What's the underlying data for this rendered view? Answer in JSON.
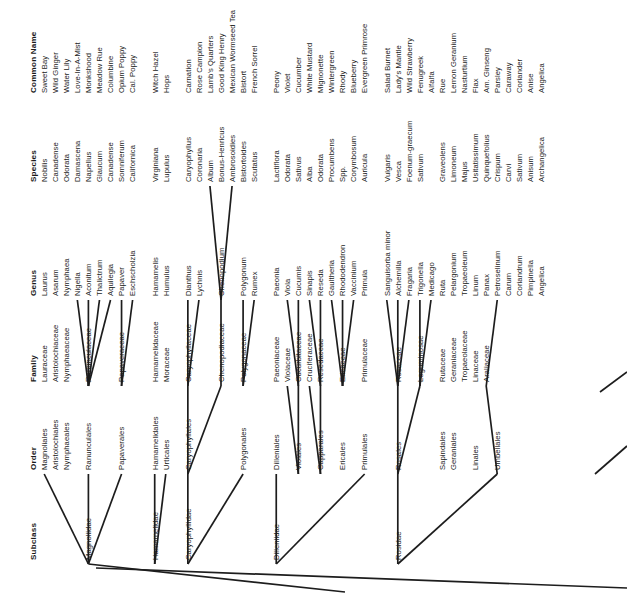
{
  "figure": {
    "kind": "taxonomic-cladogram",
    "text_orientation": "rotated-90-ccw",
    "line_color": "#1d1d1d",
    "background": "#ffffff"
  },
  "columns": [
    {
      "key": "subclass",
      "header": "Subclass",
      "y": 560
    },
    {
      "key": "order",
      "header": "Order",
      "y": 470
    },
    {
      "key": "family",
      "header": "Family",
      "y": 382
    },
    {
      "key": "genus",
      "header": "Genus",
      "y": 296
    },
    {
      "key": "species",
      "header": "Species",
      "y": 182
    },
    {
      "key": "common_name",
      "header": "Common Name",
      "y": 93
    }
  ],
  "header_x": 30,
  "row_pitch": 11.05,
  "first_row_x": 41,
  "rows": [
    {
      "i": 0,
      "common_name": "Sweet Bay",
      "species": "Nobilis",
      "genus": "Laurus",
      "family": "Lauraceae",
      "order": "Magnoliales",
      "subclass": ""
    },
    {
      "i": 1,
      "common_name": "Wild Ginger",
      "species": "Canadense",
      "genus": "Asarum",
      "family": "Aristolochiaceae",
      "order": "Aristolochiales",
      "subclass": ""
    },
    {
      "i": 2,
      "common_name": "Water Lily",
      "species": "Odorata",
      "genus": "Nymphaea",
      "family": "Nymphaeaceae",
      "order": "Nymphaeales",
      "subclass": ""
    },
    {
      "i": 3,
      "common_name": "Love-In-A-Mist",
      "species": "Damascena",
      "genus": "Nigella",
      "family": "",
      "order": "",
      "subclass": ""
    },
    {
      "i": 4,
      "common_name": "Monkshood",
      "species": "Napellus",
      "genus": "Aconitum",
      "family": "Ranunculaceae",
      "order": "Ranunculales",
      "subclass": "Magnoliidae"
    },
    {
      "i": 5,
      "common_name": "Meadow Rue",
      "species": "Glaucum",
      "genus": "Thalictrum",
      "family": "",
      "order": "",
      "subclass": ""
    },
    {
      "i": 6,
      "common_name": "Columbine",
      "species": "Canadense",
      "genus": "Aquilegia",
      "family": "",
      "order": "",
      "subclass": ""
    },
    {
      "i": 7,
      "common_name": "Opium Poppy",
      "species": "Somniferum",
      "genus": "Papaver",
      "family": "Papaveraceae",
      "order": "Papaverales",
      "subclass": ""
    },
    {
      "i": 8,
      "common_name": "Cal. Poppy",
      "species": "Californica",
      "genus": "Eschscholzia",
      "family": "",
      "order": "",
      "subclass": ""
    },
    {
      "i": 9,
      "common_name": "",
      "species": "",
      "genus": "",
      "family": "",
      "order": "",
      "subclass": ""
    },
    {
      "i": 10,
      "common_name": "Witch Hazel",
      "species": "Virginiana",
      "genus": "Hamamelis",
      "family": "Hamamelidaceae",
      "order": "Hamamelidales",
      "subclass": "Hamamelidae"
    },
    {
      "i": 11,
      "common_name": "Hops",
      "species": "Lupulus",
      "genus": "Humulus",
      "family": "Moraceae",
      "order": "Urticales",
      "subclass": ""
    },
    {
      "i": 12,
      "common_name": "",
      "species": "",
      "genus": "",
      "family": "",
      "order": "",
      "subclass": ""
    },
    {
      "i": 13,
      "common_name": "Carnation",
      "species": "Caryophyllus",
      "genus": "Dianthus",
      "family": "Caryophyllaceae",
      "order": "Caryophyllales",
      "subclass": "Caryophyllidae"
    },
    {
      "i": 14,
      "common_name": "Rose Campion",
      "species": "Coronaria",
      "genus": "Lychnis",
      "family": "",
      "order": "",
      "subclass": ""
    },
    {
      "i": 15,
      "common_name": "Lamb's Quarters",
      "species": "Album",
      "genus": "",
      "family": "",
      "order": "",
      "subclass": ""
    },
    {
      "i": 16,
      "common_name": "Good King Henry",
      "species": "Bonus-Henricus",
      "genus": "Chenopodium",
      "family": "Chenopodiaceae",
      "order": "",
      "subclass": ""
    },
    {
      "i": 17,
      "common_name": "Mexican Wormseed Tea",
      "species": "Ambrosoidies",
      "genus": "",
      "family": "",
      "order": "",
      "subclass": ""
    },
    {
      "i": 18,
      "common_name": "Bistort",
      "species": "Bistortoides",
      "genus": "Polygonum",
      "family": "Polygonaceae",
      "order": "Polygonales",
      "subclass": ""
    },
    {
      "i": 19,
      "common_name": "French Sorrel",
      "species": "Scutatus",
      "genus": "Rumex",
      "family": "",
      "order": "",
      "subclass": ""
    },
    {
      "i": 20,
      "common_name": "",
      "species": "",
      "genus": "",
      "family": "",
      "order": "",
      "subclass": ""
    },
    {
      "i": 21,
      "common_name": "Peony",
      "species": "Lactiflora",
      "genus": "Paeonia",
      "family": "Paeoniaceae",
      "order": "Dilleniales",
      "subclass": "Dilleniidae"
    },
    {
      "i": 22,
      "common_name": "Violet",
      "species": "Odorata",
      "genus": "Viola",
      "family": "Violaceae",
      "order": "",
      "subclass": ""
    },
    {
      "i": 23,
      "common_name": "Cucumber",
      "species": "Sativus",
      "genus": "Cucumis",
      "family": "Cucurbitaceae",
      "order": "Violales",
      "subclass": ""
    },
    {
      "i": 24,
      "common_name": "White Mustard",
      "species": "Alba",
      "genus": "Sinapis",
      "family": "Cruciferaceae",
      "order": "",
      "subclass": ""
    },
    {
      "i": 25,
      "common_name": "Mignonette",
      "species": "Odorata",
      "genus": "Reseda",
      "family": "Resedaceae",
      "order": "Capparales",
      "subclass": ""
    },
    {
      "i": 26,
      "common_name": "Wintergreen",
      "species": "Procumbens",
      "genus": "Gaultheria",
      "family": "",
      "order": "",
      "subclass": ""
    },
    {
      "i": 27,
      "common_name": "Rhody",
      "species": "Spp.",
      "genus": "Rhododendron",
      "family": "Ericaceae",
      "order": "Ericales",
      "subclass": ""
    },
    {
      "i": 28,
      "common_name": "Blueberry",
      "species": "Corymbosum",
      "genus": "Vaccinium",
      "family": "",
      "order": "",
      "subclass": ""
    },
    {
      "i": 29,
      "common_name": "Evergreen Primrose",
      "species": "Auricula",
      "genus": "Primula",
      "family": "Primulaceae",
      "order": "Primulales",
      "subclass": ""
    },
    {
      "i": 30,
      "common_name": "",
      "species": "",
      "genus": "",
      "family": "",
      "order": "",
      "subclass": ""
    },
    {
      "i": 31,
      "common_name": "Salad Burnet",
      "species": "Vulgaris",
      "genus": "Sanguisorba minor",
      "family": "",
      "order": "",
      "subclass": ""
    },
    {
      "i": 32,
      "common_name": "Lady's Mantle",
      "species": "Vesca",
      "genus": "Alchemilla",
      "family": "Rosaceae",
      "order": "Rosales",
      "subclass": "Rosidae"
    },
    {
      "i": 33,
      "common_name": "Wild Strawberry",
      "species": "Foenum-graecum",
      "genus": "Fragaria",
      "family": "",
      "order": "",
      "subclass": ""
    },
    {
      "i": 34,
      "common_name": "Fenugreek",
      "species": "Sativum",
      "genus": "Trigonella",
      "family": "Leguminosae",
      "order": "",
      "subclass": ""
    },
    {
      "i": 35,
      "common_name": "Alfalfa",
      "species": "",
      "genus": "Medicago",
      "family": "",
      "order": "",
      "subclass": ""
    },
    {
      "i": 36,
      "common_name": "Rue",
      "species": "Graveolens",
      "genus": "Ruta",
      "family": "Rutaceae",
      "order": "Sapindales",
      "subclass": ""
    },
    {
      "i": 37,
      "common_name": "Lemon Geranium",
      "species": "Limoneum",
      "genus": "Pelargonium",
      "family": "Geraniaceae",
      "order": "Geraniales",
      "subclass": ""
    },
    {
      "i": 38,
      "common_name": "Nasturtium",
      "species": "Majus",
      "genus": "Tropaeoleum",
      "family": "Tropaeolaceae",
      "order": "",
      "subclass": ""
    },
    {
      "i": 39,
      "common_name": "Flax",
      "species": "Usitatissimum",
      "genus": "Linum",
      "family": "Linaceae",
      "order": "Linales",
      "subclass": ""
    },
    {
      "i": 40,
      "common_name": "Am. Ginseng",
      "species": "Quinquefolius",
      "genus": "Panax",
      "family": "Araliaceae",
      "order": "",
      "subclass": ""
    },
    {
      "i": 41,
      "common_name": "Parsley",
      "species": "Crispum",
      "genus": "Petroselinum",
      "family": "",
      "order": "Umbellales",
      "subclass": ""
    },
    {
      "i": 42,
      "common_name": "Caraway",
      "species": "Carvi",
      "genus": "Carum",
      "family": "",
      "order": "",
      "subclass": ""
    },
    {
      "i": 43,
      "common_name": "Coriander",
      "species": "Sativum",
      "genus": "Coriandrum",
      "family": "",
      "order": "",
      "subclass": ""
    },
    {
      "i": 44,
      "common_name": "Anise",
      "species": "Anisum",
      "genus": "Pimpinella",
      "family": "",
      "order": "",
      "subclass": ""
    },
    {
      "i": 45,
      "common_name": "Angelica",
      "species": "Archangelica",
      "genus": "Angelica",
      "family": "",
      "order": "",
      "subclass": ""
    }
  ],
  "links": [
    {
      "from": "genus:3",
      "to": "family:4",
      "note": "Nigella to Ranunculaceae"
    },
    {
      "from": "genus:4",
      "to": "family:4",
      "note": "Aconitum to Ranunculaceae"
    },
    {
      "from": "genus:5",
      "to": "family:4",
      "note": "Thalictrum to Ranunculaceae"
    },
    {
      "from": "genus:6",
      "to": "family:4",
      "note": "Aquilegia to Ranunculaceae"
    },
    {
      "from": "genus:7",
      "to": "family:7",
      "note": "Papaver to Papaveraceae"
    },
    {
      "from": "genus:8",
      "to": "family:7",
      "note": "Eschscholzia to Papaveraceae"
    },
    {
      "from": "genus:13",
      "to": "family:13",
      "note": "Dianthus to Caryophyllaceae"
    },
    {
      "from": "genus:14",
      "to": "family:13",
      "note": "Lychnis to Caryophyllaceae"
    },
    {
      "from": "genus:16",
      "to": "family:16",
      "note": "Chenopodium to Chenopodiaceae"
    },
    {
      "from": "species:15",
      "to": "genus:16",
      "note": "Album to Chenopodium"
    },
    {
      "from": "species:17",
      "to": "genus:16",
      "note": "Ambrosoidies to Chenopodium"
    },
    {
      "from": "genus:18",
      "to": "family:18",
      "note": "Polygonum to Polygonaceae"
    },
    {
      "from": "genus:19",
      "to": "family:18",
      "note": "Rumex to Polygonaceae"
    },
    {
      "from": "genus:22",
      "to": "family:23",
      "note": "Viola to Cucurbitaceae cluster"
    },
    {
      "from": "genus:23",
      "to": "family:23",
      "note": "Cucumis to Cucurbitaceae"
    },
    {
      "from": "genus:24",
      "to": "family:25",
      "note": "Sinapis to Resedaceae cluster"
    },
    {
      "from": "genus:25",
      "to": "family:25",
      "note": "Reseda to Resedaceae"
    },
    {
      "from": "genus:26",
      "to": "family:27",
      "note": "Gaultheria to Ericaceae"
    },
    {
      "from": "genus:27",
      "to": "family:27",
      "note": "Rhododendron to Ericaceae"
    },
    {
      "from": "genus:28",
      "to": "family:27",
      "note": "Vaccinium to Ericaceae"
    },
    {
      "from": "genus:31",
      "to": "family:32",
      "note": "Sanguisorba to Rosaceae"
    },
    {
      "from": "genus:32",
      "to": "family:32",
      "note": "Alchemilla to Rosaceae"
    },
    {
      "from": "genus:33",
      "to": "family:32",
      "note": "Fragaria to Rosaceae"
    },
    {
      "from": "genus:34",
      "to": "family:34",
      "note": "Trigonella to Leguminosae"
    },
    {
      "from": "genus:35",
      "to": "family:34",
      "note": "Medicago to Leguminosae"
    },
    {
      "from": "genus:41",
      "to": "family:40",
      "note": "Petroselinum to Araliaceae/Umbelliferae"
    },
    {
      "from": "family:22",
      "to": "order:23",
      "note": "Violaceae to Violales"
    },
    {
      "from": "family:23",
      "to": "order:23",
      "note": "Cucurbitaceae to Violales"
    },
    {
      "from": "family:24",
      "to": "order:25",
      "note": "Cruciferaceae to Capparales"
    },
    {
      "from": "family:25",
      "to": "order:25",
      "note": "Resedaceae to Capparales"
    },
    {
      "from": "family:13",
      "to": "order:13",
      "note": "Caryophyllaceae to Caryophyllales"
    },
    {
      "from": "family:16",
      "to": "order:13",
      "note": "Chenopodiaceae to Caryophyllales"
    },
    {
      "from": "family:32",
      "to": "order:32",
      "note": "Rosaceae to Rosales"
    },
    {
      "from": "family:34",
      "to": "order:32",
      "note": "Leguminosae to Rosales"
    },
    {
      "from": "family:40",
      "to": "order:41",
      "note": "Araliaceae to Umbellales"
    },
    {
      "from": "order:0",
      "to": "subclass:4",
      "note": "Magnoliales to Magnoliidae"
    },
    {
      "from": "order:4",
      "to": "subclass:4",
      "note": "Ranunculales to Magnoliidae"
    },
    {
      "from": "order:7",
      "to": "subclass:4",
      "note": "Papaverales to Magnoliidae"
    },
    {
      "from": "order:10",
      "to": "subclass:10",
      "note": "Hamamelidales to Hamamelidae"
    },
    {
      "from": "order:11",
      "to": "subclass:10",
      "note": "Urticales to Hamamelidae"
    },
    {
      "from": "order:13",
      "to": "subclass:13",
      "note": "Caryophyllales to Caryophyllidae"
    },
    {
      "from": "order:18",
      "to": "subclass:13",
      "note": "Polygonales to Caryophyllidae"
    },
    {
      "from": "order:21",
      "to": "subclass:21",
      "note": "Dilleniales to Dilleniidae"
    },
    {
      "from": "order:29",
      "to": "subclass:21",
      "note": "Primulales to Dilleniidae"
    },
    {
      "from": "order:32",
      "to": "subclass:32",
      "note": "Rosales to Rosidae"
    },
    {
      "from": "order:41",
      "to": "subclass:32",
      "note": "Umbellales to Rosidae"
    },
    {
      "from": "subclass:4",
      "to": "root",
      "note": "Magnoliidae baseline to root"
    }
  ]
}
